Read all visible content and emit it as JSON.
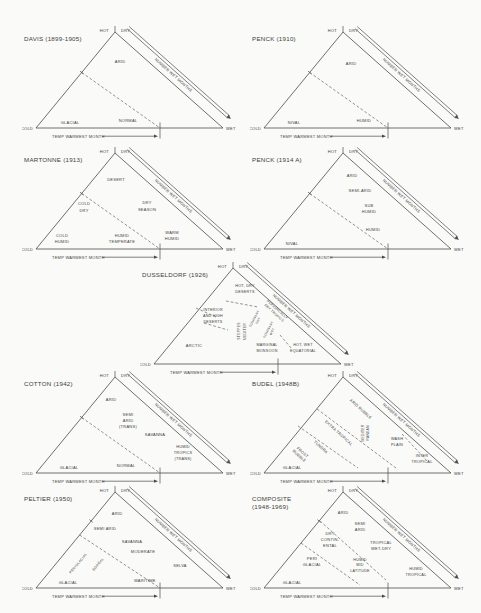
{
  "figure": {
    "background": "#fafaf8",
    "ink": "#3d3d3d",
    "line": "#4b4b4b",
    "common": {
      "apex_left": "HOT",
      "apex_right": "DRY",
      "cold": "COLD",
      "wet": "WET",
      "hypotenuse_label": "NUMBER WET MONTHS",
      "base_label": "TEMP WARMEST MONTH"
    }
  },
  "panels": [
    {
      "id": "davis",
      "title": [
        "DAVIS (1899-1905)"
      ],
      "pos": {
        "x": 22,
        "y": 25
      },
      "labels": [
        {
          "lines": [
            "ARID"
          ],
          "x": 98,
          "y": 38
        },
        {
          "lines": [
            "GLACIAL"
          ],
          "x": 48,
          "y": 98.5
        },
        {
          "lines": [
            "NORMAL"
          ],
          "x": 106,
          "y": 96.5
        }
      ],
      "dashes": [
        [
          59.7,
          47.5,
          138,
          103
        ]
      ],
      "edge_ticks": [
        [
          59.7,
          47.5
        ]
      ]
    },
    {
      "id": "penck-1910",
      "title": [
        "PENCK (1910)"
      ],
      "pos": {
        "x": 250,
        "y": 25
      },
      "labels": [
        {
          "lines": [
            "ARID"
          ],
          "x": 101,
          "y": 40
        },
        {
          "lines": [
            "NIVAL"
          ],
          "x": 44,
          "y": 98.5
        },
        {
          "lines": [
            "HUMID"
          ],
          "x": 114,
          "y": 96.5
        }
      ],
      "dashes": [
        [
          59.7,
          47.5,
          138,
          103
        ]
      ],
      "edge_ticks": [
        [
          59.7,
          47.5
        ]
      ]
    },
    {
      "id": "martonne",
      "title": [
        "MARTONNE (1913)"
      ],
      "pos": {
        "x": 22,
        "y": 146
      },
      "labels": [
        {
          "lines": [
            "DESERT"
          ],
          "x": 94,
          "y": 35
        },
        {
          "lines": [
            "COLD",
            "DRY"
          ],
          "x": 62,
          "y": 62,
          "lh": 7
        },
        {
          "lines": [
            "DRY",
            "SEASON"
          ],
          "x": 125,
          "y": 61,
          "lh": 7
        },
        {
          "lines": [
            "COLD",
            "HUMID"
          ],
          "x": 40,
          "y": 94,
          "lh": 6
        },
        {
          "lines": [
            "HUMID",
            "TEMPERATE"
          ],
          "x": 100,
          "y": 94,
          "lh": 6
        },
        {
          "lines": [
            "WARM",
            "HUMID"
          ],
          "x": 150,
          "y": 91,
          "lh": 6
        }
      ],
      "dashes": [
        [
          59.7,
          47.5,
          138,
          103
        ]
      ],
      "edge_ticks": [
        [
          59.7,
          47.5
        ]
      ]
    },
    {
      "id": "penck-1914a",
      "title": [
        "PENCK (1914 A)"
      ],
      "pos": {
        "x": 250,
        "y": 146
      },
      "labels": [
        {
          "lines": [
            "ARID"
          ],
          "x": 102,
          "y": 31
        },
        {
          "lines": [
            "SEMI-ARID"
          ],
          "x": 110,
          "y": 46
        },
        {
          "lines": [
            "SUB",
            "HUMID"
          ],
          "x": 119,
          "y": 64,
          "lh": 6
        },
        {
          "lines": [
            "HUMID"
          ],
          "x": 123,
          "y": 85
        },
        {
          "lines": [
            "NIVAL"
          ],
          "x": 42,
          "y": 98.5
        }
      ],
      "dashes": [
        [
          59.7,
          47.5,
          138,
          103
        ]
      ],
      "edge_ticks": [
        [
          59.7,
          47.5
        ]
      ]
    },
    {
      "id": "dusseldorf",
      "title": [
        "DUSSELDORF (1926)"
      ],
      "pos": {
        "x": 140,
        "y": 261
      },
      "labels": [
        {
          "lines": [
            "HOT, DRY",
            "DESERTS"
          ],
          "x": 105,
          "y": 29,
          "lh": 6,
          "fs": 3.8
        },
        {
          "lines": [
            "INTERIOR",
            "AND HIGH",
            "DESERTS"
          ],
          "x": 73,
          "y": 56,
          "lh": 6,
          "fs": 3.7
        },
        {
          "lines": [
            "ARCTIC"
          ],
          "x": 54,
          "y": 86
        },
        {
          "lines": [
            "STEPPES",
            "MEDITER."
          ],
          "x": 103,
          "y": 70,
          "r": -90,
          "lh": 5.5,
          "fs": 3.4
        },
        {
          "lines": [
            "MARGINAL",
            "MONSOON"
          ],
          "x": 127,
          "y": 88,
          "lh": 5.5,
          "fs": 3.7
        },
        {
          "lines": [
            "HOT, WET",
            "EQUATORIAL"
          ],
          "x": 163,
          "y": 88,
          "lh": 5.5,
          "fs": 3.7
        },
        {
          "lines": [
            "PERIODICALLY",
            "DRY TROPICS"
          ],
          "x": 135,
          "y": 51,
          "r": 42,
          "lh": 4.6,
          "fs": 3.3
        },
        {
          "lines": [
            "DOMINANT",
            "DRY"
          ],
          "x": 117,
          "y": 59,
          "r": -62,
          "lh": 4.4,
          "fs": 3.1
        },
        {
          "lines": [
            "DOMINANT",
            "WET"
          ],
          "x": 131,
          "y": 70,
          "r": -62,
          "lh": 4.4,
          "fs": 3.1
        }
      ],
      "dashes": [
        [
          86,
          40,
          118,
          46
        ],
        [
          56,
          47,
          76,
          56
        ],
        [
          64,
          62,
          88,
          69
        ],
        [
          140,
          74,
          152,
          88
        ]
      ],
      "edge_ticks": []
    },
    {
      "id": "cotton",
      "title": [
        "COTTON (1942)"
      ],
      "pos": {
        "x": 22,
        "y": 370
      },
      "labels": [
        {
          "lines": [
            "ARID"
          ],
          "x": 89,
          "y": 31
        },
        {
          "lines": [
            "SEMI",
            "ARID",
            "(TRANS)"
          ],
          "x": 106,
          "y": 52,
          "lh": 6
        },
        {
          "lines": [
            "SAVANNA"
          ],
          "x": 133,
          "y": 66
        },
        {
          "lines": [
            "GLACIAL"
          ],
          "x": 47,
          "y": 98.5
        },
        {
          "lines": [
            "NORMAL"
          ],
          "x": 104,
          "y": 96.5
        },
        {
          "lines": [
            "HUMID",
            "TROPICS",
            "(TRANS)"
          ],
          "x": 161,
          "y": 84,
          "lh": 6,
          "fs": 3.8
        }
      ],
      "dashes": [
        [
          59.7,
          47.5,
          138,
          103
        ]
      ],
      "edge_ticks": [
        [
          59.7,
          47.5
        ]
      ]
    },
    {
      "id": "budel",
      "title": [
        "BUDEL (1948B)"
      ],
      "pos": {
        "x": 250,
        "y": 370
      },
      "labels": [
        {
          "lines": [
            "ARID RUBBLE"
          ],
          "x": 110,
          "y": 40,
          "r": 42,
          "fs": 3.8
        },
        {
          "lines": [
            "EXTRA TROPICAL"
          ],
          "x": 88,
          "y": 64,
          "r": 42,
          "fs": 3.8
        },
        {
          "lines": [
            "MEDITER",
            "RANEAN"
          ],
          "x": 116,
          "y": 63,
          "r": -90,
          "lh": 5,
          "fs": 3.4
        },
        {
          "lines": [
            "TUNDRA"
          ],
          "x": 70,
          "y": 78,
          "r": 42,
          "fs": 3.8
        },
        {
          "lines": [
            "FROST",
            "RUBBLE"
          ],
          "x": 50,
          "y": 85,
          "r": 42,
          "lh": 5,
          "fs": 3.8
        },
        {
          "lines": [
            "GLACIAL"
          ],
          "x": 42,
          "y": 98.5
        },
        {
          "lines": [
            "WASH",
            "PLAIN"
          ],
          "x": 147,
          "y": 73,
          "lh": 6,
          "fs": 3.8
        },
        {
          "lines": [
            "INTER",
            "TROPICAL"
          ],
          "x": 172,
          "y": 90,
          "lh": 6,
          "fs": 3.8
        }
      ],
      "dashes": [
        [
          67,
          39,
          146,
          98
        ],
        [
          48,
          56,
          108,
          98
        ],
        [
          152,
          64,
          178,
          92
        ]
      ],
      "edge_ticks": []
    },
    {
      "id": "peltier",
      "title": [
        "PELTIER (1950)"
      ],
      "pos": {
        "x": 22,
        "y": 485
      },
      "labels": [
        {
          "lines": [
            "ARID"
          ],
          "x": 95,
          "y": 30
        },
        {
          "lines": [
            "SEMI ARID"
          ],
          "x": 83,
          "y": 45
        },
        {
          "lines": [
            "SAVANNA"
          ],
          "x": 110,
          "y": 58
        },
        {
          "lines": [
            "MODERATE"
          ],
          "x": 121,
          "y": 68
        },
        {
          "lines": [
            "PERIGLACIAL"
          ],
          "x": 57,
          "y": 79,
          "r": -50,
          "fs": 3.5
        },
        {
          "lines": [
            "BOREAL"
          ],
          "x": 77,
          "y": 80,
          "r": -50,
          "fs": 3.5
        },
        {
          "lines": [
            "GLACIAL"
          ],
          "x": 46,
          "y": 98.5
        },
        {
          "lines": [
            "MARITIME"
          ],
          "x": 123,
          "y": 96.5
        },
        {
          "lines": [
            "SELVA"
          ],
          "x": 158,
          "y": 82
        }
      ],
      "dashes": [
        [
          57.6,
          50,
          138,
          103
        ]
      ],
      "edge_ticks": [
        [
          69.1,
          36
        ]
      ]
    },
    {
      "id": "composite",
      "title": [
        "COMPOSITE",
        "(1948-1969)"
      ],
      "pos": {
        "x": 250,
        "y": 485
      },
      "labels": [
        {
          "lines": [
            "ARID"
          ],
          "x": 93,
          "y": 29
        },
        {
          "lines": [
            "SEMI",
            "ARID"
          ],
          "x": 110,
          "y": 43,
          "lh": 6
        },
        {
          "lines": [
            "DRY",
            "CONTIN-",
            "ENTAL"
          ],
          "x": 80,
          "y": 56,
          "lh": 6
        },
        {
          "lines": [
            "TROPICAL",
            "WET-DRY"
          ],
          "x": 131,
          "y": 62,
          "lh": 6
        },
        {
          "lines": [
            "PERI",
            "GLACIAL"
          ],
          "x": 62,
          "y": 78,
          "lh": 6
        },
        {
          "lines": [
            "HUMID",
            "MID",
            "LATITUDE"
          ],
          "x": 110,
          "y": 81,
          "lh": 5.5,
          "fs": 3.7
        },
        {
          "lines": [
            "GLACIAL"
          ],
          "x": 42,
          "y": 98.5
        },
        {
          "lines": [
            "HUMID",
            "TROPICAL"
          ],
          "x": 166,
          "y": 88,
          "lh": 6,
          "fs": 3.8
        }
      ],
      "dashes": [
        [
          70,
          36,
          136,
          95
        ],
        [
          51,
          58,
          110,
          100
        ]
      ],
      "edge_ticks": [
        [
          69.1,
          36
        ]
      ]
    }
  ]
}
